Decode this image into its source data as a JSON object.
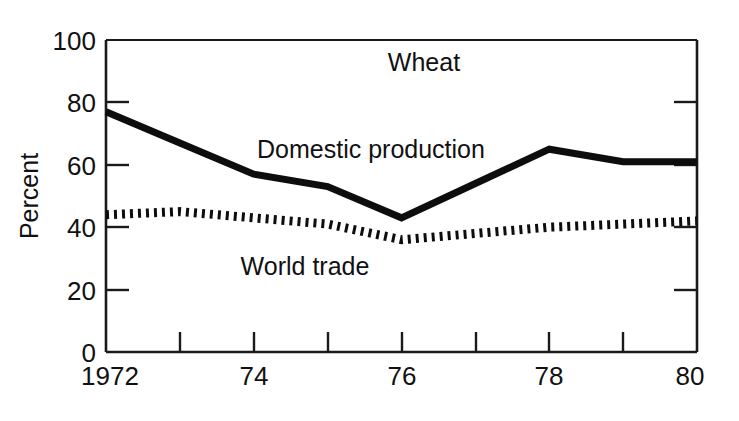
{
  "chart_data": {
    "type": "line",
    "title": "Wheat",
    "xlabel": "",
    "ylabel": "Percent",
    "xlim": [
      1972,
      1980
    ],
    "ylim": [
      0,
      100
    ],
    "grid": false,
    "legend_position": "inline-annotation",
    "x": [
      1972,
      1973,
      1974,
      1975,
      1976,
      1977,
      1978,
      1979,
      1980
    ],
    "x_tick_values": [
      1972,
      1973,
      1974,
      1975,
      1976,
      1977,
      1978,
      1979,
      1980
    ],
    "x_tick_labels": [
      "1972",
      "",
      "74",
      "",
      "76",
      "",
      "78",
      "",
      "80"
    ],
    "y_tick_values": [
      0,
      20,
      40,
      60,
      80,
      100
    ],
    "y_tick_labels": [
      "0",
      "20",
      "40",
      "60",
      "80",
      "100"
    ],
    "series": [
      {
        "name": "Domestic production",
        "style": "solid",
        "color": "#0d0d0d",
        "values": [
          77,
          67,
          57,
          53,
          43,
          54,
          65,
          61,
          61
        ],
        "label_text": "Domestic production"
      },
      {
        "name": "World trade",
        "style": "dotted",
        "color": "#0d0d0d",
        "values": [
          44,
          45,
          43,
          41,
          36,
          38,
          40,
          41,
          42
        ],
        "label_text": "World trade"
      }
    ]
  },
  "labels": {
    "title": "Wheat",
    "ylabel": "Percent",
    "series_solid": "Domestic production",
    "series_dotted": "World trade",
    "y_0": "0",
    "y_20": "20",
    "y_40": "40",
    "y_60": "60",
    "y_80": "80",
    "y_100": "100",
    "x_1972": "1972",
    "x_74": "74",
    "x_76": "76",
    "x_78": "78",
    "x_80": "80"
  }
}
